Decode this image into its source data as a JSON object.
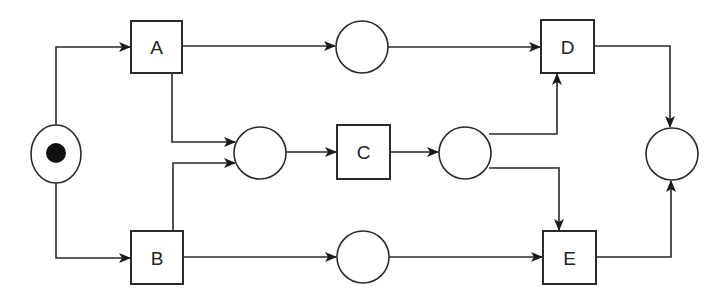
{
  "diagram": {
    "type": "petri-net",
    "colors": {
      "stroke": "#2a2a2a",
      "fill": "#ffffff",
      "token": "#111111"
    },
    "places": [
      {
        "id": "p_start",
        "cx": 56,
        "cy": 154,
        "rx": 25,
        "ry": 29,
        "tokens": 1
      },
      {
        "id": "p_top",
        "cx": 362,
        "cy": 47,
        "rx": 26,
        "ry": 26,
        "tokens": 0
      },
      {
        "id": "p_mid_left",
        "cx": 260,
        "cy": 153,
        "rx": 26,
        "ry": 26,
        "tokens": 0
      },
      {
        "id": "p_mid_right",
        "cx": 465,
        "cy": 153,
        "rx": 26,
        "ry": 26,
        "tokens": 0
      },
      {
        "id": "p_bottom",
        "cx": 363,
        "cy": 257,
        "rx": 26,
        "ry": 26,
        "tokens": 0
      },
      {
        "id": "p_end",
        "cx": 672,
        "cy": 154,
        "rx": 26,
        "ry": 26,
        "tokens": 0
      }
    ],
    "transitions": [
      {
        "id": "A",
        "label": "A",
        "x": 131,
        "y": 21,
        "w": 51,
        "h": 52
      },
      {
        "id": "B",
        "label": "B",
        "x": 131,
        "y": 231,
        "w": 52,
        "h": 53
      },
      {
        "id": "C",
        "label": "C",
        "x": 337,
        "y": 125,
        "w": 53,
        "h": 54
      },
      {
        "id": "D",
        "label": "D",
        "x": 541,
        "y": 20,
        "w": 53,
        "h": 53
      },
      {
        "id": "E",
        "label": "E",
        "x": 543,
        "y": 231,
        "w": 53,
        "h": 53
      }
    ],
    "arcs": [
      {
        "from": "p_start",
        "to": "A"
      },
      {
        "from": "p_start",
        "to": "B"
      },
      {
        "from": "A",
        "to": "p_top"
      },
      {
        "from": "A",
        "to": "p_mid_left"
      },
      {
        "from": "B",
        "to": "p_mid_left"
      },
      {
        "from": "B",
        "to": "p_bottom"
      },
      {
        "from": "p_mid_left",
        "to": "C"
      },
      {
        "from": "C",
        "to": "p_mid_right"
      },
      {
        "from": "p_top",
        "to": "D"
      },
      {
        "from": "p_mid_right",
        "to": "D"
      },
      {
        "from": "p_mid_right",
        "to": "E"
      },
      {
        "from": "p_bottom",
        "to": "E"
      },
      {
        "from": "D",
        "to": "p_end"
      },
      {
        "from": "E",
        "to": "p_end"
      }
    ]
  }
}
